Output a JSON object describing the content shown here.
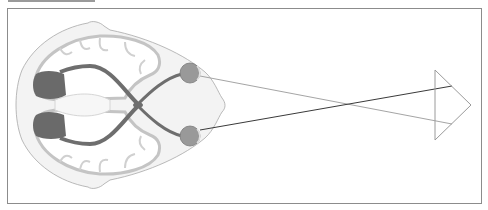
{
  "header": {
    "clipped_caption": ""
  },
  "diagram": {
    "title": "",
    "colors": {
      "frame": "#8c8c8c",
      "head_fill": "#f3f3f3",
      "head_stroke": "#a8a8a8",
      "brain_fill": "#ffffff",
      "brain_stroke": "#c4c4c4",
      "pathway": "#6e6e6e",
      "cortex": "#6a6a6a",
      "eye_fill": "#999999",
      "ray_light": "#9a9a9a",
      "ray_dark": "#3a3a3a",
      "object_arrow": "#9a9a9a"
    },
    "elements": [
      "head-outline",
      "brain-hemispheres",
      "visual-cortex-left",
      "visual-cortex-right",
      "optic-tracts",
      "optic-chiasm",
      "eye-top",
      "eye-bottom",
      "ray-upper",
      "ray-lower",
      "object-arrow"
    ]
  }
}
